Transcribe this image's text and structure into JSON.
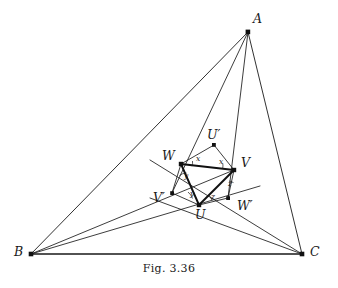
{
  "figure": {
    "caption": "Fig. 3.36",
    "stroke_color": "#1a1a1a",
    "background_color": "#ffffff",
    "outer_triangle_label": "Triangle ABC",
    "inner_triangle_label": "Triangle UVW"
  },
  "vertices": {
    "A": {
      "label": "A",
      "x": 248,
      "y": 32,
      "label_x": 253,
      "label_y": 13
    },
    "B": {
      "label": "B",
      "x": 31,
      "y": 254,
      "label_x": 14,
      "label_y": 246
    },
    "C": {
      "label": "C",
      "x": 302,
      "y": 254,
      "label_x": 310,
      "label_y": 246
    },
    "U": {
      "label": "U",
      "x": 199,
      "y": 205,
      "label_x": 195,
      "label_y": 209
    },
    "V": {
      "label": "V",
      "x": 234,
      "y": 170,
      "label_x": 241,
      "label_y": 157
    },
    "W": {
      "label": "W",
      "x": 181,
      "y": 164,
      "label_x": 162,
      "label_y": 150
    },
    "U'": {
      "label": "U′",
      "x": 214,
      "y": 145,
      "label_x": 207,
      "label_y": 129
    },
    "V'": {
      "label": "V′",
      "x": 172,
      "y": 193,
      "label_x": 153,
      "label_y": 192
    },
    "W'": {
      "label": "W′",
      "x": 228,
      "y": 198,
      "label_x": 237,
      "label_y": 200
    }
  },
  "angles": [
    {
      "name": "angle-x-at-W",
      "label": "x",
      "x": 196,
      "y": 158
    },
    {
      "name": "angle-x-at-V",
      "label": "x",
      "x": 219,
      "y": 161
    },
    {
      "name": "angle-y-at-W",
      "label": "y",
      "x": 184,
      "y": 176
    },
    {
      "name": "angle-y-at-U",
      "label": "y",
      "x": 190,
      "y": 194
    },
    {
      "name": "angle-z-at-V",
      "label": "z",
      "x": 228,
      "y": 184
    },
    {
      "name": "angle-z-at-U",
      "label": "z",
      "x": 211,
      "y": 197
    }
  ],
  "edges": {
    "outer_triangle": [
      {
        "name": "edge-A-B",
        "from": "A",
        "to": "B"
      },
      {
        "name": "edge-B-C",
        "from": "B",
        "to": "C"
      },
      {
        "name": "edge-C-A",
        "from": "C",
        "to": "A"
      }
    ],
    "cevians": [
      {
        "name": "cevian-A-through-W-to-V-prime",
        "from": "A",
        "to": "V'"
      },
      {
        "name": "cevian-A-through-V-to-W-prime",
        "from": "A",
        "to": "W'"
      },
      {
        "name": "cevian-B-through-W-to-V",
        "from": "B",
        "to": "V"
      },
      {
        "name": "cevian-B-through-U-to-W-prime",
        "from": "B",
        "to": "W'"
      },
      {
        "name": "cevian-C-through-V-to-W",
        "from": "C",
        "to": "W"
      },
      {
        "name": "cevian-C-through-U-to-V-prime",
        "from": "C",
        "to": "V'"
      }
    ],
    "inner_triangle": [
      {
        "name": "edge-U-V",
        "from": "U",
        "to": "V"
      },
      {
        "name": "edge-V-W",
        "from": "V",
        "to": "W"
      },
      {
        "name": "edge-W-U",
        "from": "W",
        "to": "U"
      }
    ],
    "inner_quads": [
      {
        "name": "edge-W-Uprime",
        "from": "W",
        "to": "U'"
      },
      {
        "name": "edge-Uprime-V",
        "from": "U'",
        "to": "V"
      },
      {
        "name": "edge-V-Wprime",
        "from": "V",
        "to": "W'"
      },
      {
        "name": "edge-Wprime-U",
        "from": "W'",
        "to": "U"
      },
      {
        "name": "edge-U-Vprime",
        "from": "U",
        "to": "V'"
      },
      {
        "name": "edge-Vprime-W",
        "from": "V'",
        "to": "W"
      }
    ]
  }
}
